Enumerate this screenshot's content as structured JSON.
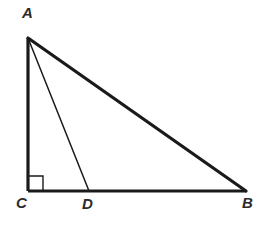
{
  "figure": {
    "name": "right-triangle-with-cevian",
    "background_color": "#ffffff",
    "stroke_color": "#1a1a1a",
    "label_color": "#2b2b2b",
    "points": {
      "A": {
        "x": 28,
        "y": 38,
        "label": "A",
        "label_x": 22,
        "label_y": 5
      },
      "B": {
        "x": 246,
        "y": 191,
        "label": "B",
        "label_x": 242,
        "label_y": 195
      },
      "C": {
        "x": 28,
        "y": 191,
        "label": "C",
        "label_x": 16,
        "label_y": 195
      },
      "D": {
        "x": 89,
        "y": 191,
        "label": "D",
        "label_x": 82,
        "label_y": 196
      }
    },
    "segments": [
      {
        "name": "segment-AC",
        "from": "A",
        "to": "C",
        "width": 3.2
      },
      {
        "name": "segment-CB",
        "from": "C",
        "to": "B",
        "width": 3.2
      },
      {
        "name": "segment-AB",
        "from": "A",
        "to": "B",
        "width": 3.2
      },
      {
        "name": "segment-AD",
        "from": "A",
        "to": "D",
        "width": 1.5
      }
    ],
    "right_angle_marker": {
      "at_vertex": "C",
      "size": 15,
      "width": 1.4
    }
  }
}
